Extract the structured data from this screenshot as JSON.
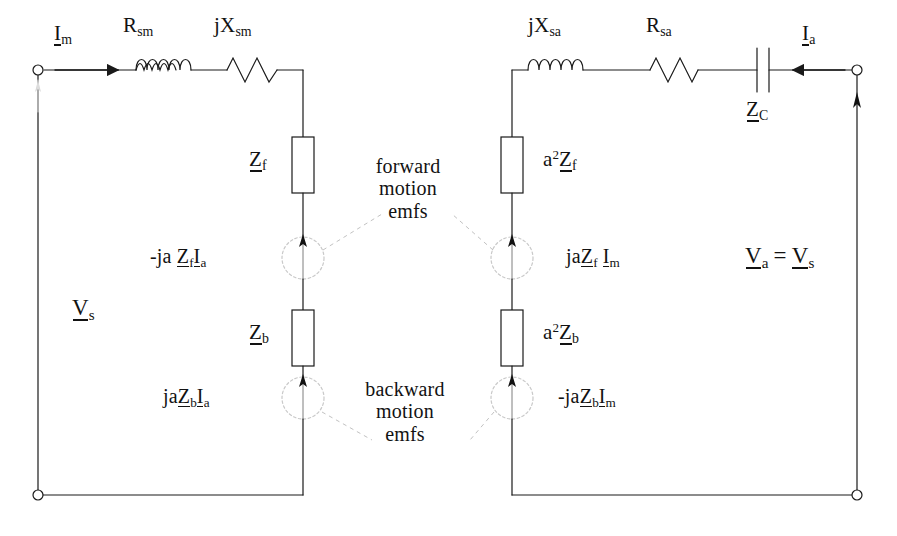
{
  "diagram": {
    "stroke_color": "#1a1a1a",
    "dashed_color": "#b9b9b9",
    "background": "#ffffff"
  },
  "labels": {
    "current_main": {
      "text": "I",
      "sub": "m",
      "underline": true
    },
    "current_aux": {
      "text": "I",
      "sub": "a",
      "underline": true
    },
    "r_sm": {
      "text": "R",
      "sub": "sm"
    },
    "jx_sm": {
      "text": "jX",
      "sub": "sm"
    },
    "jx_sa": {
      "text": "jX",
      "sub": "sa"
    },
    "r_sa": {
      "text": "R",
      "sub": "sa"
    },
    "z_c": {
      "text": "Z",
      "sub": "C",
      "underline": true
    },
    "v_s": {
      "text": "V",
      "sub": "s",
      "underline": true
    },
    "v_a_eq_v_s": {
      "text": "V_a = V_s",
      "parts": [
        "V",
        "a",
        "=",
        "V",
        "s"
      ]
    },
    "z_f": {
      "text": "Z",
      "sub": "f",
      "underline": true
    },
    "z_b": {
      "text": "Z",
      "sub": "b",
      "underline": true
    },
    "a2_z_f": {
      "text": "a2Zf",
      "prefix": "a",
      "power": "2",
      "main": "Z",
      "sub": "f"
    },
    "a2_z_b": {
      "text": "a2Zb",
      "prefix": "a",
      "power": "2",
      "main": "Z",
      "sub": "b"
    },
    "src_top_left": {
      "text": "-ja Z_f I_a"
    },
    "src_bottom_left": {
      "text": "jaZ_b I_a"
    },
    "src_top_right": {
      "text": "jaZ_f I_m"
    },
    "src_bottom_right": {
      "text": "-jaZ_b I_m"
    },
    "note_forward": {
      "line1": "forward",
      "line2": "motion",
      "line3": "emfs"
    },
    "note_backward": {
      "line1": "backward",
      "line2": "motion",
      "line3": "emfs"
    }
  },
  "components": {
    "main_branch": [
      {
        "name": "inductor-main",
        "symbol": "coil",
        "label": "R_sm"
      },
      {
        "name": "resistor-main",
        "symbol": "zigzag",
        "label": "jX_sm"
      }
    ],
    "aux_branch": [
      {
        "name": "inductor-aux",
        "symbol": "coil",
        "label": "jX_sa"
      },
      {
        "name": "resistor-aux",
        "symbol": "zigzag",
        "label": "R_sa"
      },
      {
        "name": "capacitor-aux",
        "symbol": "capacitor",
        "label": "Z_C"
      }
    ],
    "impedance_blocks": [
      {
        "name": "block-zf",
        "label": "Z_f"
      },
      {
        "name": "block-zb",
        "label": "Z_b"
      },
      {
        "name": "block-a2zf",
        "label": "a2Z_f"
      },
      {
        "name": "block-a2zb",
        "label": "a2Z_b"
      }
    ],
    "sources": [
      {
        "name": "source-forward-main",
        "label": "-ja Z_f I_a",
        "arrow": "up"
      },
      {
        "name": "source-backward-main",
        "label": "jaZ_b I_a",
        "arrow": "up"
      },
      {
        "name": "source-forward-aux",
        "label": "jaZ_f I_m",
        "arrow": "up"
      },
      {
        "name": "source-backward-aux",
        "label": "-jaZ_b I_m",
        "arrow": "up"
      }
    ],
    "terminals": [
      {
        "name": "terminal-top-left",
        "x": 38,
        "y": 70
      },
      {
        "name": "terminal-bottom-left",
        "x": 38,
        "y": 495
      },
      {
        "name": "terminal-top-right",
        "x": 857,
        "y": 70
      },
      {
        "name": "terminal-bottom-right",
        "x": 857,
        "y": 495
      }
    ]
  }
}
